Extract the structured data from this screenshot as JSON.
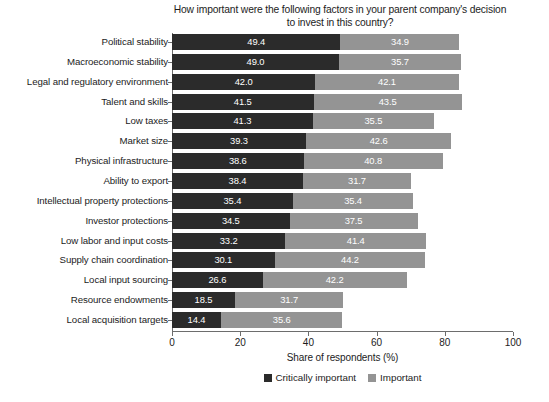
{
  "chart_data": {
    "type": "bar",
    "subtype": "stacked-horizontal-bar",
    "title": "How important were the following factors in your parent company's decision\nto invest in this country?",
    "xlabel": "Share of respondents (%)",
    "ylabel": "",
    "xlim": [
      0,
      100
    ],
    "xticks": [
      0,
      20,
      40,
      60,
      80,
      100
    ],
    "xtick_labels": [
      "0",
      "20",
      "40",
      "60",
      "80",
      "100"
    ],
    "grid": false,
    "legend_position": "bottom",
    "orientation": "horizontal",
    "categories": [
      "Political stability",
      "Macroeconomic stability",
      "Legal and regulatory environment",
      "Talent and skills",
      "Low taxes",
      "Market size",
      "Physical infrastructure",
      "Ability to export",
      "Intellectual property protections",
      "Investor protections",
      "Low labor and input costs",
      "Supply chain coordination",
      "Local input sourcing",
      "Resource endowments",
      "Local acquisition targets"
    ],
    "series": [
      {
        "name": "Critically important",
        "color": "#2b2b2b",
        "values": [
          49.4,
          49.0,
          42.0,
          41.5,
          41.3,
          39.3,
          38.6,
          38.4,
          35.4,
          34.5,
          33.2,
          30.1,
          26.6,
          18.5,
          14.4
        ],
        "labels": [
          "49.4",
          "49.0",
          "42.0",
          "41.5",
          "41.3",
          "39.3",
          "38.6",
          "38.4",
          "35.4",
          "34.5",
          "33.2",
          "30.1",
          "26.6",
          "18.5",
          "14.4"
        ]
      },
      {
        "name": "Important",
        "color": "#949494",
        "values": [
          34.9,
          35.7,
          42.1,
          43.5,
          35.5,
          42.6,
          40.8,
          31.7,
          35.4,
          37.5,
          41.4,
          44.2,
          42.2,
          31.7,
          35.6
        ],
        "labels": [
          "34.9",
          "35.7",
          "42.1",
          "43.5",
          "35.5",
          "42.6",
          "40.8",
          "31.7",
          "35.4",
          "37.5",
          "41.4",
          "44.2",
          "42.2",
          "31.7",
          "35.6"
        ]
      }
    ]
  },
  "legend": {
    "items": [
      {
        "label": "Critically important",
        "color": "#2b2b2b"
      },
      {
        "label": "Important",
        "color": "#949494"
      }
    ]
  },
  "colors": {
    "critical": "#2b2b2b",
    "important": "#949494",
    "axis": "#6d6d6d",
    "text": "#1c1c1c",
    "background": "#ffffff",
    "value_label": "#ffffff"
  }
}
